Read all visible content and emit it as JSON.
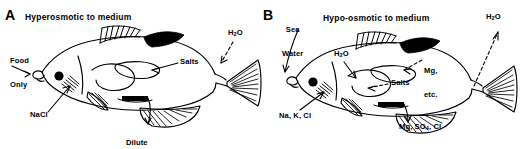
{
  "figure": {
    "background": "#ffffff",
    "ink": "#000000",
    "panels": [
      {
        "letter": "A",
        "title": "Hyperosmotic to medium",
        "fish_orientation": "left-facing",
        "labels": [
          {
            "name": "food-only",
            "text": "Food\nOnly",
            "x": 12,
            "y": 44,
            "arrow": "right-down"
          },
          {
            "name": "nacl",
            "text": "NaCl",
            "x": 32,
            "y": 116,
            "arrow": "up-right"
          },
          {
            "name": "salts",
            "text": "Salts",
            "x": 160,
            "y": 60,
            "arrow": "left"
          },
          {
            "name": "dilute-urine",
            "text": "Dilute\nUrine",
            "x": 130,
            "y": 126,
            "arrow": "down"
          },
          {
            "name": "water-out",
            "text": "H2O",
            "x": 228,
            "y": 31,
            "arrow": "down-left"
          }
        ]
      },
      {
        "letter": "B",
        "title": "Hypo-osmotic to medium",
        "fish_orientation": "left-facing",
        "labels": [
          {
            "name": "sea-water",
            "text": "Sea\nWater",
            "x": 286,
            "y": 12,
            "arrow": "down-left"
          },
          {
            "name": "water-in",
            "text": "H2O",
            "x": 336,
            "y": 52,
            "arrow": "down-right"
          },
          {
            "name": "mg-etc",
            "text": "Mg,\netc.",
            "x": 424,
            "y": 54,
            "arrow": "left"
          },
          {
            "name": "salts",
            "text": "Salts",
            "x": 390,
            "y": 81,
            "arrow": "left"
          },
          {
            "name": "na-k-cl",
            "text": "Na, K, Cl",
            "x": 280,
            "y": 114,
            "arrow": "up-right"
          },
          {
            "name": "mg-so4-cl",
            "text": "Mg, SO4, Cl",
            "x": 402,
            "y": 124,
            "arrow": "down"
          },
          {
            "name": "water-out",
            "text": "H2O",
            "x": 487,
            "y": 15,
            "arrow": "up-right"
          }
        ]
      }
    ]
  },
  "panelA": {
    "letter": "A",
    "title": "Hyperosmotic to medium",
    "food_only_line1": "Food",
    "food_only_line2": "Only",
    "nacl": "NaCl",
    "salts": "Salts",
    "dilute_line1": "Dilute",
    "dilute_line2": "Urine",
    "h2o_main": "H",
    "h2o_sub": "2",
    "h2o_tail": "O"
  },
  "panelB": {
    "letter": "B",
    "title": "Hypo-osmotic to medium",
    "sea_line1": "Sea",
    "sea_line2": "Water",
    "h2o_in_main": "H",
    "h2o_in_sub": "2",
    "h2o_in_tail": "O",
    "mg_line1": "Mg,",
    "mg_line2": "etc.",
    "salts": "Salts",
    "na_k_cl": "Na, K, Cl",
    "mg_so4_pre": "Mg, SO",
    "mg_so4_sub": "4",
    "mg_so4_post": ", Cl",
    "h2o_out_main": "H",
    "h2o_out_sub": "2",
    "h2o_out_tail": "O"
  }
}
